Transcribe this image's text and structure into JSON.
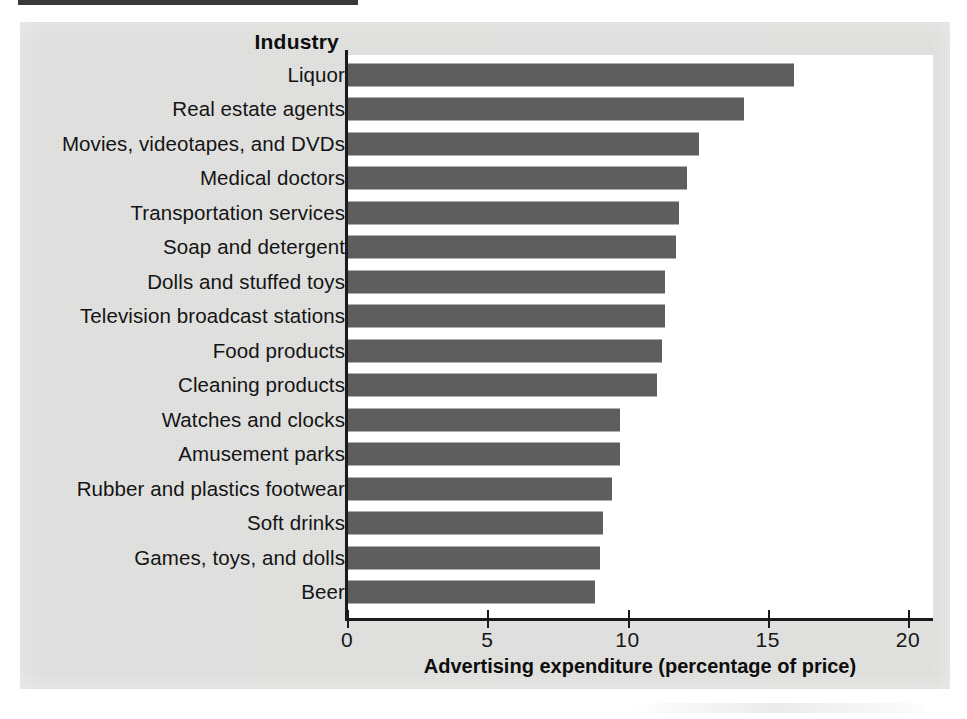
{
  "figure": {
    "column_header": "Industry",
    "x_axis_title": "Advertising expenditure (percentage of price)",
    "bar_color": "#5e5e5e",
    "paper_color": "#e3e3e1",
    "plot_background": "#ffffff",
    "axis_color": "#1b1b1b"
  },
  "chart_data": {
    "type": "bar",
    "orientation": "horizontal",
    "title": "",
    "subtitle": "",
    "xlabel": "Advertising expenditure (percentage of price)",
    "ylabel": "Industry",
    "xlim": [
      0,
      20
    ],
    "xticks": [
      0,
      5,
      10,
      15,
      20
    ],
    "xtick_labels": [
      "0",
      "5",
      "10",
      "15",
      "20"
    ],
    "grid": false,
    "legend": null,
    "categories": [
      "Liquor",
      "Real estate agents",
      "Movies, videotapes, and DVDs",
      "Medical doctors",
      "Transportation services",
      "Soap and detergent",
      "Dolls and stuffed toys",
      "Television broadcast stations",
      "Food products",
      "Cleaning products",
      "Watches and clocks",
      "Amusement parks",
      "Rubber and plastics footwear",
      "Soft drinks",
      "Games, toys, and dolls",
      "Beer"
    ],
    "values": [
      15.9,
      14.1,
      12.5,
      12.1,
      11.8,
      11.7,
      11.3,
      11.3,
      11.2,
      11.0,
      9.7,
      9.7,
      9.4,
      9.1,
      9.0,
      8.8
    ]
  }
}
